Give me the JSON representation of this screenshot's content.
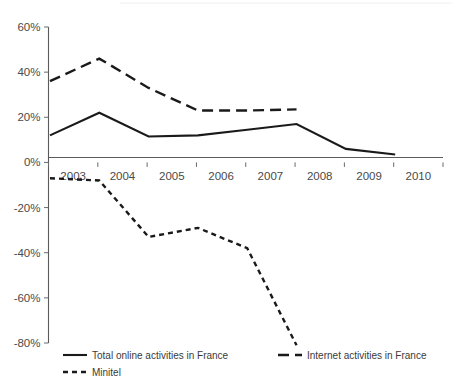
{
  "chart_data": {
    "type": "line",
    "title": "",
    "subtitle": "",
    "xlabel": "",
    "ylabel": "",
    "x": [
      "2003",
      "2004",
      "2005",
      "2006",
      "2007",
      "2008",
      "2009",
      "2010"
    ],
    "categories": [
      "2003",
      "2004",
      "2005",
      "2006",
      "2007",
      "2008",
      "2009",
      "2010"
    ],
    "xlim": [
      "2003",
      "2010"
    ],
    "ylim": [
      -80,
      60
    ],
    "ytick_values": [
      60,
      40,
      20,
      0,
      -20,
      -40,
      -60,
      -80
    ],
    "ytick_labels": [
      "60%",
      "40%",
      "20%",
      "0%",
      "-20%",
      "-40%",
      "-60%",
      "-80%"
    ],
    "xtick_labels": [
      "2003",
      "2004",
      "2005",
      "2006",
      "2007",
      "2008",
      "2009",
      "2010"
    ],
    "grid": false,
    "legend_position": "bottom",
    "series": [
      {
        "name": "Total online activities in France",
        "style": "solid",
        "color": "#1a1a1a",
        "values": [
          12,
          22,
          11.5,
          12,
          14.5,
          17,
          6,
          3.5
        ]
      },
      {
        "name": "Internet activities in France",
        "style": "long-dash",
        "color": "#1a1a1a",
        "values": [
          36,
          46,
          33,
          23,
          23,
          23.5,
          null,
          null
        ]
      },
      {
        "name": "Minitel",
        "style": "short-dash",
        "color": "#1a1a1a",
        "values": [
          -7,
          -8,
          -33,
          -29,
          -38,
          -81,
          null,
          null
        ]
      }
    ],
    "legend": [
      {
        "label": "Total online activities in France",
        "style": "solid"
      },
      {
        "label": "Internet activities in France",
        "style": "long-dash"
      },
      {
        "label": "Minitel",
        "style": "short-dash"
      }
    ]
  }
}
